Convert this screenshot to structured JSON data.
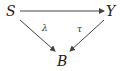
{
  "diagram": {
    "type": "commutative-triangle",
    "nodes": {
      "top_left": "S",
      "top_right": "Y",
      "bottom": "B"
    },
    "arrows": [
      {
        "from": "S",
        "to": "Y",
        "label": ""
      },
      {
        "from": "S",
        "to": "B",
        "label": "λ"
      },
      {
        "from": "Y",
        "to": "B",
        "label": "τ"
      }
    ],
    "labels": {
      "s_to_b": "λ",
      "y_to_b": "τ"
    },
    "colors": {
      "stroke": "#444444",
      "text": "#222222"
    }
  }
}
